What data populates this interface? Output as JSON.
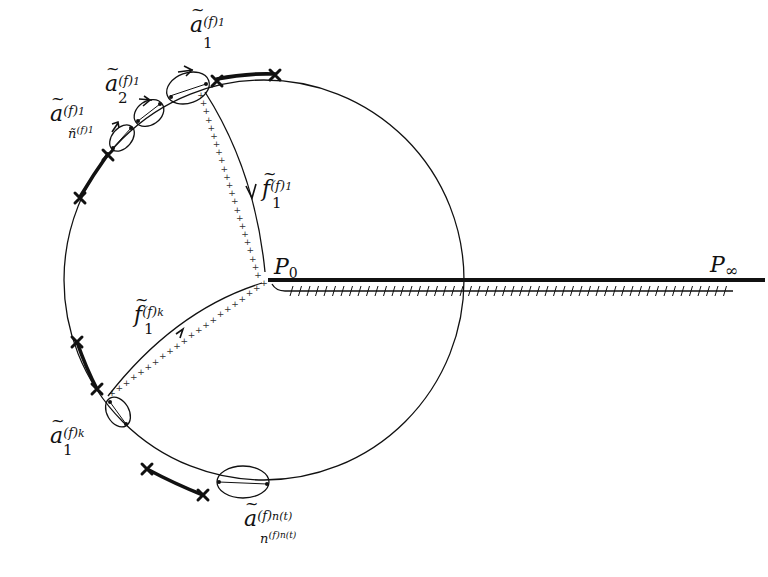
{
  "diagram": {
    "title": "",
    "circle": {
      "cx": 264,
      "cy": 280,
      "r": 200
    },
    "points": {
      "p0": {
        "label": "P",
        "subscript": "0",
        "x": 268,
        "y": 280
      },
      "pinf": {
        "label": "P",
        "subscript": "∞",
        "x": 765,
        "y": 280
      }
    },
    "labels": {
      "a1_1": {
        "base": "a",
        "sub": "1",
        "sup": "(f)",
        "sup_sub": "1"
      },
      "a2_1": {
        "base": "a",
        "sub": "2",
        "sup": "(f)",
        "sup_sub": "1"
      },
      "an_1": {
        "base": "a",
        "sup": "(f)",
        "sup_sub": "1",
        "sub": "ñ",
        "sub_sup": "(f)",
        "sub_sup_sub": "1"
      },
      "f1_1": {
        "base": "f",
        "sub": "1",
        "sup": "(f)",
        "sup_sub": "1"
      },
      "f1_k": {
        "base": "f",
        "sub": "1",
        "sup": "(f)",
        "sup_sub": "k"
      },
      "a1_k": {
        "base": "a",
        "sub": "1",
        "sup": "(f)",
        "sup_sub": "k"
      },
      "an_t": {
        "base": "a",
        "sup": "(f)",
        "sup_sub": "n(t)",
        "sub": "n",
        "sub_sup": "(f)",
        "sub_sup_sub": "n(t)"
      }
    },
    "markers": {
      "cross_count": 9,
      "ellipse_count": 5
    },
    "colors": {
      "stroke": "#111111",
      "background": "#ffffff"
    }
  }
}
